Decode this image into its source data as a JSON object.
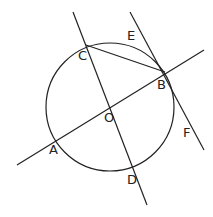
{
  "diagram": {
    "type": "geometry",
    "labels": {
      "A": "A",
      "B": "B",
      "C": "C",
      "D": "D",
      "E": "E",
      "F": "F",
      "O": "O"
    }
  }
}
